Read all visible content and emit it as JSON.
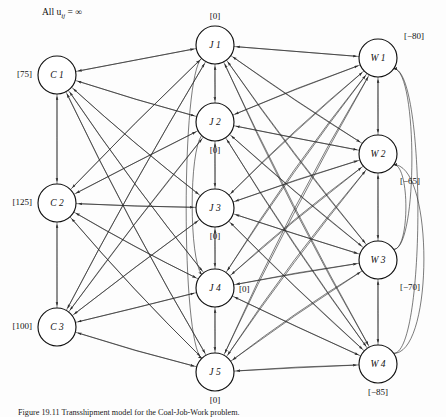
{
  "figure": {
    "title_note": "All u",
    "title_note_sub": "ij",
    "title_note_eq": " = ∞",
    "caption": "Figure 19.11   Transshipment model for the Coal-Job-Work problem.",
    "background": "#ffffff",
    "arc_color": "#2a2a2a",
    "node_fill": "#ffffff",
    "node_stroke": "#111111"
  },
  "graph": {
    "type": "network-flow-transshipment",
    "node_radius": 19,
    "columns": [
      {
        "name": "supply",
        "x": 57
      },
      {
        "name": "transshipment",
        "x": 215
      },
      {
        "name": "demand",
        "x": 378
      }
    ],
    "nodes": [
      {
        "id": "C1",
        "label": "C 1",
        "supply": "[75]",
        "x": 57,
        "y": 75,
        "col": "supply",
        "label_pos": "left"
      },
      {
        "id": "C2",
        "label": "C 2",
        "supply": "[125]",
        "x": 57,
        "y": 203,
        "col": "supply",
        "label_pos": "left"
      },
      {
        "id": "C3",
        "label": "C 3",
        "supply": "[100]",
        "x": 57,
        "y": 327,
        "col": "supply",
        "label_pos": "left"
      },
      {
        "id": "J1",
        "label": "J 1",
        "supply": "[0]",
        "x": 215,
        "y": 45,
        "col": "transshipment",
        "label_pos": "top"
      },
      {
        "id": "J2",
        "label": "J 2",
        "supply": "[0]",
        "x": 215,
        "y": 122,
        "col": "transshipment",
        "label_pos": "bottom"
      },
      {
        "id": "J3",
        "label": "J 3",
        "supply": "[0]",
        "x": 215,
        "y": 208,
        "col": "transshipment",
        "label_pos": "bottom"
      },
      {
        "id": "J4",
        "label": "J 4",
        "supply": "[0]",
        "x": 215,
        "y": 288,
        "col": "transshipment",
        "label_pos": "right"
      },
      {
        "id": "J5",
        "label": "J 5",
        "supply": "[0]",
        "x": 215,
        "y": 372,
        "col": "transshipment",
        "label_pos": "bottom"
      },
      {
        "id": "W1",
        "label": "W 1",
        "supply": "[−80]",
        "x": 378,
        "y": 58,
        "col": "demand",
        "label_pos": "topright"
      },
      {
        "id": "W2",
        "label": "W 2",
        "supply": "[−65]",
        "x": 378,
        "y": 154,
        "col": "demand",
        "label_pos": "bottomright"
      },
      {
        "id": "W3",
        "label": "W 3",
        "supply": "[−70]",
        "x": 378,
        "y": 260,
        "col": "demand",
        "label_pos": "bottomright"
      },
      {
        "id": "W4",
        "label": "W 4",
        "supply": "[−85]",
        "x": 378,
        "y": 364,
        "col": "demand",
        "label_pos": "bottom"
      }
    ],
    "arc_groups": [
      {
        "name": "supply-to-transshipment",
        "from": [
          "C1",
          "C2",
          "C3"
        ],
        "to": [
          "J1",
          "J2",
          "J3",
          "J4",
          "J5"
        ]
      },
      {
        "name": "transshipment-to-supply",
        "from": [
          "J1",
          "J2",
          "J3",
          "J4",
          "J5"
        ],
        "to": [
          "C1",
          "C2",
          "C3"
        ]
      },
      {
        "name": "transshipment-to-demand",
        "from": [
          "J1",
          "J2",
          "J3",
          "J4",
          "J5"
        ],
        "to": [
          "W1",
          "W2",
          "W3",
          "W4"
        ]
      },
      {
        "name": "demand-to-transshipment",
        "from": [
          "W1",
          "W2",
          "W3",
          "W4"
        ],
        "to": [
          "J1",
          "J2",
          "J3",
          "J4",
          "J5"
        ]
      },
      {
        "name": "supply-chain-vertical",
        "from": [
          "C1",
          "C2",
          "C3"
        ],
        "to": [
          "C1",
          "C2",
          "C3"
        ]
      },
      {
        "name": "transshipment-vertical",
        "from": [
          "J1",
          "J2",
          "J3",
          "J4",
          "J5"
        ],
        "to": [
          "J1",
          "J2",
          "J3",
          "J4",
          "J5"
        ]
      },
      {
        "name": "demand-vertical",
        "from": [
          "W1",
          "W2",
          "W3",
          "W4"
        ],
        "to": [
          "W1",
          "W2",
          "W3",
          "W4"
        ]
      }
    ]
  }
}
